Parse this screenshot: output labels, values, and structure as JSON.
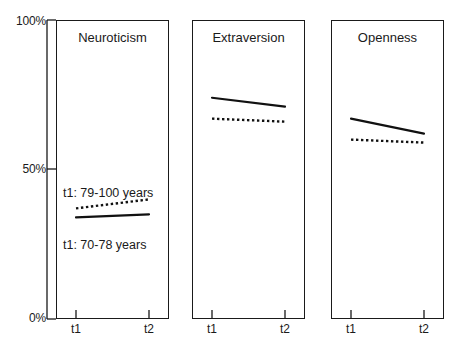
{
  "chart_data": {
    "type": "line",
    "title": "",
    "xlabel": "",
    "ylabel": "",
    "ylim": [
      0,
      100
    ],
    "x": [
      "t1",
      "t2"
    ],
    "xtick_labels": [
      "t1",
      "t2"
    ],
    "ytick_labels": [
      "100%",
      "50%",
      "0%"
    ],
    "ytick_values": [
      100,
      50,
      0
    ],
    "grid": false,
    "legend_position": "inline-annotations",
    "panels": [
      {
        "name": "Neuroticism",
        "title": "Neuroticism",
        "series": [
          {
            "name": "t1: 79-100 years",
            "style": "dotted",
            "values": [
              37,
              40
            ],
            "annotation": "t1: 79-100 years",
            "annotation_position": "above"
          },
          {
            "name": "t1: 70-78 years",
            "style": "solid",
            "values": [
              34,
              35
            ],
            "annotation": "t1: 70-78 years",
            "annotation_position": "below"
          }
        ]
      },
      {
        "name": "Extraversion",
        "title": "Extraversion",
        "series": [
          {
            "name": "t1: 70-78 years",
            "style": "solid",
            "values": [
              74,
              71
            ],
            "annotation": "",
            "annotation_position": ""
          },
          {
            "name": "t1: 79-100 years",
            "style": "dotted",
            "values": [
              67,
              66
            ],
            "annotation": "",
            "annotation_position": ""
          }
        ]
      },
      {
        "name": "Openness",
        "title": "Openness",
        "series": [
          {
            "name": "t1: 70-78 years",
            "style": "solid",
            "values": [
              67,
              62
            ],
            "annotation": "",
            "annotation_position": ""
          },
          {
            "name": "t1: 79-100 years",
            "style": "dotted",
            "values": [
              60,
              59
            ],
            "annotation": "",
            "annotation_position": ""
          }
        ]
      }
    ]
  },
  "axis": {
    "y_top_label": "100%",
    "y_mid_label": "50%",
    "y_bottom_label": "0%"
  },
  "panels": {
    "neuroticism": {
      "title": "Neuroticism",
      "upper_annotation": "t1: 79-100 years",
      "lower_annotation": "t1: 70-78 years",
      "tick_t1": "t1",
      "tick_t2": "t2"
    },
    "extraversion": {
      "title": "Extraversion",
      "tick_t1": "t1",
      "tick_t2": "t2"
    },
    "openness": {
      "title": "Openness",
      "tick_t1": "t1",
      "tick_t2": "t2"
    }
  },
  "colors": {
    "ink": "#1a1a1a",
    "background": "#ffffff"
  }
}
